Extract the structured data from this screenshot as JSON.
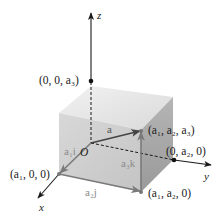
{
  "figure": {
    "axes": {
      "x": {
        "label": "x"
      },
      "y": {
        "label": "y"
      },
      "z": {
        "label": "z"
      }
    },
    "origin_label": "O",
    "points": {
      "z_point": "(0, 0, a₃)",
      "x_point": "(a₁, 0, 0)",
      "y_point": "(0, a₂, 0)",
      "corner_top": "(a₁, a₂, a₃)",
      "corner_bottom": "(a₁, a₂, 0)"
    },
    "vectors": {
      "a": "a",
      "a1i": "a₁i",
      "a2j": "a₂j",
      "a3k": "a₃k"
    },
    "colors": {
      "box_top": "#e6e6e6",
      "box_front": "#d2d2d2",
      "box_right": "#a9a9a9",
      "axis": "#1a1a1a",
      "vector": "#7a7a7a",
      "vector_a": "#444444"
    }
  }
}
